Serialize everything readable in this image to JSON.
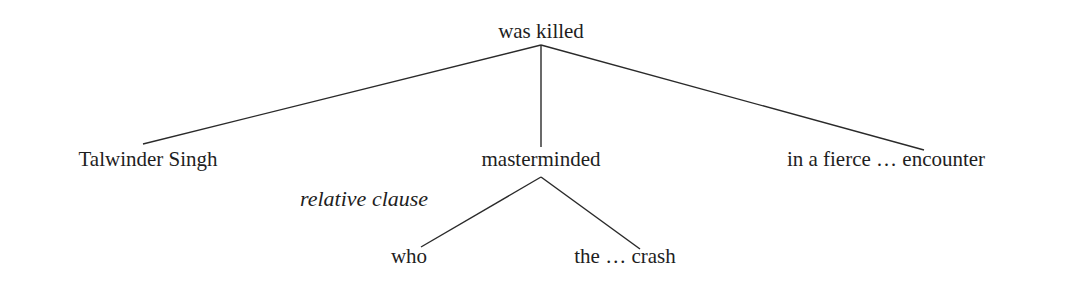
{
  "diagram": {
    "type": "dependency-tree",
    "root": {
      "label": "was killed"
    },
    "children": [
      {
        "label": "Talwinder Singh"
      },
      {
        "label": "masterminded"
      },
      {
        "label": "in a fierce … encounter"
      }
    ],
    "subtree": {
      "parent": "masterminded",
      "annotation": "relative clause",
      "children": [
        {
          "label": "who"
        },
        {
          "label": "the … crash"
        }
      ]
    }
  }
}
